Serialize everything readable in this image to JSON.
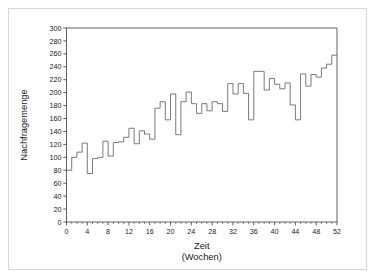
{
  "chart_data": {
    "type": "line",
    "subtype": "step",
    "title": "",
    "xlabel": "Zeit",
    "xlabel_sub": "(Wochen)",
    "ylabel": "Nachfragemenge",
    "xlim": [
      0,
      52
    ],
    "ylim": [
      0,
      300
    ],
    "xticks": [
      0,
      4,
      8,
      12,
      16,
      20,
      24,
      28,
      32,
      36,
      40,
      44,
      48,
      52
    ],
    "xtick_labels": [
      "0",
      "4",
      "8",
      "12",
      "16",
      "20",
      "24",
      "28",
      "32",
      "36",
      "40",
      "44",
      "48",
      "52"
    ],
    "xminor_step": 1,
    "yticks": [
      0,
      20,
      40,
      60,
      80,
      100,
      120,
      140,
      160,
      180,
      200,
      220,
      240,
      260,
      280,
      300
    ],
    "ytick_labels": [
      "0",
      "20",
      "40",
      "60",
      "80",
      "100",
      "120",
      "140",
      "160",
      "180",
      "200",
      "220",
      "240",
      "260",
      "280",
      "300"
    ],
    "grid": false,
    "legend": false,
    "line_color": "#6b6b6b",
    "axis_color": "#3a3a3a",
    "background": "#ffffff",
    "x": [
      1,
      2,
      3,
      4,
      5,
      6,
      7,
      8,
      9,
      10,
      11,
      12,
      13,
      14,
      15,
      16,
      17,
      18,
      19,
      20,
      21,
      22,
      23,
      24,
      25,
      26,
      27,
      28,
      29,
      30,
      31,
      32,
      33,
      34,
      35,
      36,
      37,
      38,
      39,
      40,
      41,
      42,
      43,
      44,
      45,
      46,
      47,
      48,
      49,
      50,
      51,
      52
    ],
    "values": [
      80,
      100,
      108,
      122,
      75,
      98,
      100,
      125,
      102,
      123,
      124,
      131,
      145,
      121,
      141,
      136,
      128,
      176,
      186,
      158,
      198,
      135,
      186,
      201,
      183,
      168,
      183,
      172,
      186,
      183,
      171,
      214,
      198,
      214,
      199,
      158,
      233,
      233,
      204,
      222,
      213,
      206,
      215,
      181,
      158,
      229,
      210,
      228,
      224,
      238,
      244,
      258
    ],
    "series": [
      {
        "name": "Nachfragemenge",
        "values": [
          80,
          100,
          108,
          122,
          75,
          98,
          100,
          125,
          102,
          123,
          124,
          131,
          145,
          121,
          141,
          136,
          128,
          176,
          186,
          158,
          198,
          135,
          186,
          201,
          183,
          168,
          183,
          172,
          186,
          183,
          171,
          214,
          198,
          214,
          199,
          158,
          233,
          233,
          204,
          222,
          213,
          206,
          215,
          181,
          158,
          229,
          210,
          228,
          224,
          238,
          244,
          258
        ]
      }
    ]
  }
}
